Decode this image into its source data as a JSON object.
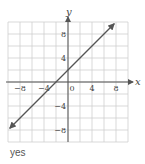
{
  "chart_data": {
    "type": "line",
    "title": "",
    "xlabel": "x",
    "ylabel": "y",
    "xlim": [
      -10,
      10
    ],
    "ylim": [
      -10,
      10
    ],
    "grid": true,
    "grid_step": 2,
    "x_ticks": [
      -8,
      -4,
      0,
      4,
      8
    ],
    "y_ticks": [
      8,
      4,
      -4,
      -8
    ],
    "x_tick_labels": [
      "−8",
      "−4",
      "0",
      "4",
      "8"
    ],
    "y_tick_labels": [
      "8",
      "4",
      "−4",
      "−8"
    ],
    "series": [
      {
        "name": "y = x + 2",
        "equation": "y = x + 2",
        "x": [
          -9.7,
          7.7
        ],
        "y": [
          -7.7,
          9.7
        ],
        "arrows": "both"
      }
    ],
    "colors": {
      "grid": "#cfcfcf",
      "axis": "#555555",
      "line": "#555555"
    }
  },
  "answer": {
    "text": "yes"
  }
}
